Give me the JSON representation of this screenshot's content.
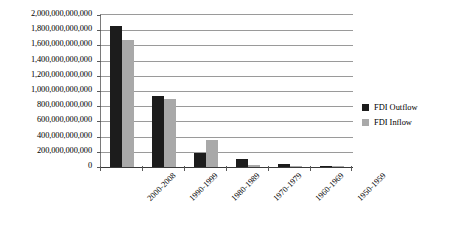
{
  "chart_data": {
    "type": "bar",
    "title": "",
    "xlabel": "",
    "ylabel": "",
    "categories": [
      "2000-2008",
      "1990-1999",
      "1980-1989",
      "1970-1979",
      "1960-1969",
      "1950-1959"
    ],
    "series": [
      {
        "name": "FDI Outflow",
        "color": "#1c1c1c",
        "values": [
          1850000000000,
          930000000000,
          190000000000,
          110000000000,
          40000000000,
          15000000000
        ]
      },
      {
        "name": "FDI Inflow",
        "color": "#a9a9a9",
        "values": [
          1670000000000,
          900000000000,
          350000000000,
          30000000000,
          12000000000,
          5000000000
        ]
      }
    ],
    "ylim": [
      0,
      2000000000000
    ],
    "ytick_values": [
      0,
      200000000000,
      400000000000,
      600000000000,
      800000000000,
      1000000000000,
      1200000000000,
      1400000000000,
      1600000000000,
      1800000000000,
      2000000000000
    ],
    "ytick_labels": [
      "0",
      "200,000,000,000",
      "400,000,000,000",
      "600,000,000,000",
      "800,000,000,000",
      "1,000,000,000,000",
      "1,200,000,000,000",
      "1,400,000,000,000",
      "1,600,000,000,000",
      "1,800,000,000,000",
      "2,000,000,000,000"
    ],
    "grid": true,
    "legend_position": "right",
    "legend": [
      {
        "label": "FDI Outflow",
        "color": "#1c1c1c"
      },
      {
        "label": "FDI Inflow",
        "color": "#a9a9a9"
      }
    ]
  }
}
